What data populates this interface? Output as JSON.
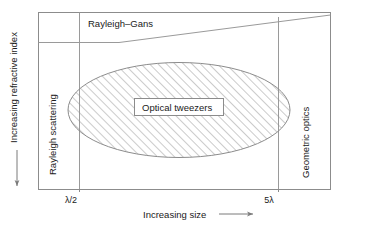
{
  "figure": {
    "axes": {
      "y_label": "Increasing refractive index",
      "y_arrow_direction": "down",
      "x_label": "Increasing size",
      "x_arrow_direction": "right"
    },
    "x_ticks": [
      {
        "label": "λ/2",
        "position_px": 79
      },
      {
        "label": "5λ",
        "position_px": 278
      }
    ],
    "regions": [
      {
        "id": "rayleigh-scattering",
        "label": "Rayleigh scattering",
        "orientation": "vertical"
      },
      {
        "id": "rayleigh-gans",
        "label": "Rayleigh–Gans",
        "orientation": "horizontal"
      },
      {
        "id": "geometric-optics",
        "label": "Geometric optics",
        "orientation": "vertical"
      },
      {
        "id": "optical-tweezers",
        "label": "Optical tweezers",
        "orientation": "horizontal"
      }
    ],
    "highlight": {
      "shape": "ellipse",
      "fill": "hatched",
      "label": "Optical tweezers"
    },
    "colors": {
      "line": "#8c8c8c",
      "text": "#1a1a1a",
      "background": "#ffffff",
      "hatch": "#8c8c8c"
    }
  }
}
